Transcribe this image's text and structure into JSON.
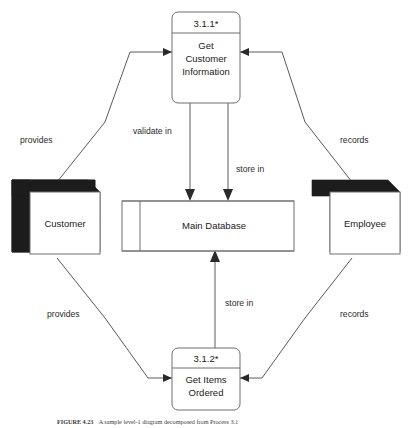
{
  "figure": {
    "caption_label": "FIGURE 4.23",
    "caption_text": "A sample level-1 diagram decomposed from Process 3.1"
  },
  "diagram": {
    "colors": {
      "background": "#ffffff",
      "shape_stroke": "#6e6e6e",
      "entity_shadow": "#1c1c1c",
      "text": "#1a1a1a",
      "flow_line": "#5a5a5a"
    },
    "processes": [
      {
        "id": "3.1.1*",
        "name_line1": "Get",
        "name_line2": "Customer",
        "name_line3": "Information"
      },
      {
        "id": "3.1.2*",
        "name_line1": "Get Items",
        "name_line2": "Ordered",
        "name_line3": ""
      }
    ],
    "entities": [
      {
        "name": "Customer"
      },
      {
        "name": "Employee"
      }
    ],
    "datastores": [
      {
        "name": "Main Database"
      }
    ],
    "flows": [
      {
        "label": "provides",
        "from": "Customer",
        "to": "3.1.1*"
      },
      {
        "label": "records",
        "from": "Employee",
        "to": "3.1.1*"
      },
      {
        "label": "validate in",
        "from": "3.1.1*",
        "to": "Main Database"
      },
      {
        "label": "store in",
        "from": "3.1.1*",
        "to": "Main Database"
      },
      {
        "label": "provides",
        "from": "Customer",
        "to": "3.1.2*"
      },
      {
        "label": "records",
        "from": "Employee",
        "to": "3.1.2*"
      },
      {
        "label": "store in",
        "from": "3.1.2*",
        "to": "Main Database"
      }
    ]
  }
}
